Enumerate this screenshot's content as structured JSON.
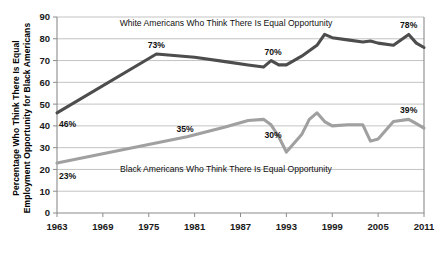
{
  "chart_data": {
    "type": "line",
    "title": "",
    "xlabel": "",
    "ylabel_line1": "Percentage Who Think There Is Equal",
    "ylabel_line2": "Employment Opportunity for Black Americans",
    "xlim": [
      1963,
      2011
    ],
    "ylim": [
      0,
      90
    ],
    "yticks": [
      0,
      10,
      20,
      30,
      40,
      50,
      60,
      70,
      80,
      90
    ],
    "xticks": [
      1963,
      1969,
      1975,
      1981,
      1987,
      1993,
      1999,
      2005,
      2011
    ],
    "grid": true,
    "legend_position": "inline-annotations",
    "series": [
      {
        "name": "White Americans Who Think There Is Equal Opportunity",
        "color": "#4d4d4d",
        "inline_label": "White Americans Who Think There Is Equal Opportunity",
        "x": [
          1963,
          1976,
          1981,
          1985,
          1988,
          1990,
          1991,
          1992,
          1993,
          1995,
          1997,
          1998,
          1999,
          2001,
          2003,
          2004,
          2005,
          2007,
          2009,
          2010,
          2011
        ],
        "values": [
          46,
          73,
          71.5,
          69.5,
          68,
          67,
          70,
          68,
          68,
          72,
          77,
          82,
          80.5,
          79.5,
          78.5,
          79,
          78,
          77,
          82,
          78,
          76
        ],
        "point_labels": [
          {
            "x": 1963,
            "value": 46,
            "text": "46%"
          },
          {
            "x": 1976,
            "value": 73,
            "text": "73%"
          },
          {
            "x": 1991,
            "value": 70,
            "text": "70%"
          },
          {
            "x": 2009,
            "value": 82,
            "text": "78%"
          }
        ]
      },
      {
        "name": "Black Americans Who Think There Is Equal Opportunity",
        "color": "#a0a0a0",
        "inline_label": "Black Americans Who Think There Is Equal Opportunity",
        "x": [
          1963,
          1980,
          1985,
          1988,
          1990,
          1991,
          1992,
          1993,
          1995,
          1996,
          1997,
          1998,
          1999,
          2001,
          2003,
          2004,
          2005,
          2006,
          2007,
          2009,
          2010,
          2011
        ],
        "values": [
          23,
          35,
          39.5,
          42.5,
          43,
          40.5,
          35,
          28,
          36,
          43,
          46,
          42,
          40,
          40.5,
          40.5,
          33,
          34,
          38,
          42,
          43,
          41,
          39
        ],
        "point_labels": [
          {
            "x": 1963,
            "value": 23,
            "text": "23%"
          },
          {
            "x": 1980,
            "value": 35,
            "text": "35%"
          },
          {
            "x": 1991,
            "value": 40.5,
            "text": "30%"
          },
          {
            "x": 2009,
            "value": 43,
            "text": "39%"
          }
        ]
      }
    ]
  }
}
